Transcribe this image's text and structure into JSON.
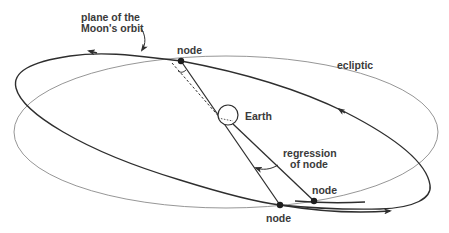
{
  "diagram": {
    "labels": {
      "moon_orbit_plane_line1": "plane of the",
      "moon_orbit_plane_line2": "Moon's orbit",
      "ecliptic": "ecliptic",
      "earth": "Earth",
      "node_top": "node",
      "node_bottom": "node",
      "node_shifted": "node",
      "regression_line1": "regression",
      "regression_line2": "of node"
    },
    "colors": {
      "moon_orbit": "#2e2e2e",
      "ecliptic": "#8a8a8a",
      "text": "#3a3a3a",
      "background": "#ffffff"
    },
    "elements": [
      {
        "name": "ecliptic",
        "type": "ellipse",
        "style": "thin gray"
      },
      {
        "name": "moon-orbit",
        "type": "tilted ellipse",
        "style": "thick dark",
        "direction_arrows": 3
      },
      {
        "name": "earth",
        "type": "circle"
      },
      {
        "name": "node-top",
        "type": "point"
      },
      {
        "name": "node-bottom",
        "type": "point"
      },
      {
        "name": "node-shifted",
        "type": "point"
      },
      {
        "name": "line-of-nodes",
        "type": "line",
        "style": "solid"
      },
      {
        "name": "shifted-line-of-nodes",
        "type": "line",
        "style": "dashed"
      },
      {
        "name": "regression-arrow",
        "type": "curved arrow"
      }
    ]
  }
}
